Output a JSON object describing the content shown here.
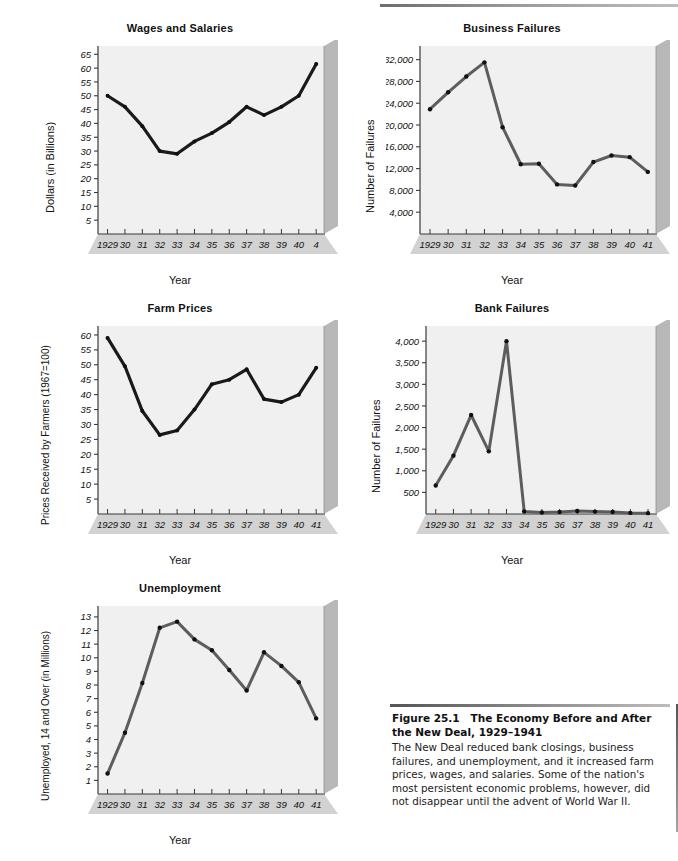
{
  "page": {
    "figure_number": "Figure 25.1",
    "figure_title": "The Economy Before and After the New Deal, 1929–1941",
    "caption_text": "The New Deal reduced bank closings, business failures, and unemployment, and it increased farm prices, wages, and salaries. Some of the nation's most persistent economic problems, however, did not disappear until the advent of World War II."
  },
  "style": {
    "line_color": "#5d5d5d",
    "line_color_dark": "#1a1a1a",
    "plot_bg": "#f0f0f0",
    "bevel_shadow": "#b4b4b4",
    "axis_color": "#3a3a3a",
    "text_color": "#111111"
  },
  "chart_data": [
    {
      "id": "wages-and-salaries",
      "type": "line",
      "title": "Wages and Salaries",
      "xlabel": "Year",
      "ylabel": "Dollars (in Billions)",
      "categories": [
        "1929",
        "30",
        "31",
        "32",
        "33",
        "34",
        "35",
        "36",
        "37",
        "38",
        "39",
        "40",
        "41"
      ],
      "tick_labels": [
        "1929",
        "30",
        "31",
        "32",
        "33",
        "34",
        "35",
        "36",
        "37",
        "38",
        "39",
        "40",
        "4"
      ],
      "yticks": [
        5,
        10,
        15,
        20,
        25,
        30,
        35,
        40,
        45,
        50,
        55,
        60,
        65
      ],
      "ylim": [
        0,
        68
      ],
      "values": [
        50.0,
        46.0,
        39.0,
        30.0,
        29.0,
        33.5,
        36.5,
        40.5,
        46.0,
        43.0,
        46.0,
        50.0,
        61.5
      ],
      "grid": false
    },
    {
      "id": "business-failures",
      "type": "line",
      "title": "Business Failures",
      "xlabel": "Year",
      "ylabel": "Number of Failures",
      "categories": [
        "1929",
        "30",
        "31",
        "32",
        "33",
        "34",
        "35",
        "36",
        "37",
        "38",
        "39",
        "40",
        "41"
      ],
      "tick_labels": [
        "1929",
        "30",
        "31",
        "32",
        "33",
        "34",
        "35",
        "36",
        "37",
        "38",
        "39",
        "40",
        "41"
      ],
      "yticks": [
        4000,
        8000,
        12000,
        16000,
        20000,
        24000,
        28000,
        32000
      ],
      "ytick_labels": [
        "4,000",
        "8,000",
        "12,000",
        "16,000",
        "20,000",
        "24,000",
        "28,000",
        "32,000"
      ],
      "ylim": [
        0,
        34500
      ],
      "values": [
        22900,
        26000,
        28900,
        31500,
        19600,
        12800,
        12900,
        9100,
        8900,
        13200,
        14400,
        14100,
        11400
      ],
      "grid": false
    },
    {
      "id": "farm-prices",
      "type": "line",
      "title": "Farm Prices",
      "xlabel": "Year",
      "ylabel": "Prices Received by Farmers (1967=100)",
      "categories": [
        "1929",
        "30",
        "31",
        "32",
        "33",
        "34",
        "35",
        "36",
        "37",
        "38",
        "39",
        "40",
        "41"
      ],
      "tick_labels": [
        "1929",
        "30",
        "31",
        "32",
        "33",
        "34",
        "35",
        "36",
        "37",
        "38",
        "39",
        "40",
        "41"
      ],
      "yticks": [
        5,
        10,
        15,
        20,
        25,
        30,
        35,
        40,
        45,
        50,
        55,
        60
      ],
      "ylim": [
        0,
        63
      ],
      "values": [
        59.0,
        49.5,
        34.5,
        26.5,
        28.0,
        35.0,
        43.5,
        45.0,
        48.5,
        38.5,
        37.5,
        40.0,
        49.0
      ],
      "grid": false
    },
    {
      "id": "bank-failures",
      "type": "line",
      "title": "Bank Failures",
      "xlabel": "Year",
      "ylabel": "Number of Failures",
      "categories": [
        "1929",
        "30",
        "31",
        "32",
        "33",
        "34",
        "35",
        "36",
        "37",
        "38",
        "39",
        "40",
        "41"
      ],
      "tick_labels": [
        "1929",
        "30",
        "31",
        "32",
        "33",
        "34",
        "35",
        "36",
        "37",
        "38",
        "39",
        "40",
        "41"
      ],
      "yticks": [
        500,
        1000,
        1500,
        2000,
        2500,
        3000,
        3500,
        4000
      ],
      "ytick_labels": [
        "500",
        "1,000",
        "1,500",
        "2,000",
        "2,500",
        "3,000",
        "3,500",
        "4,000"
      ],
      "ylim": [
        0,
        4350
      ],
      "values": [
        660,
        1350,
        2290,
        1450,
        4000,
        60,
        35,
        45,
        70,
        55,
        45,
        25,
        20
      ],
      "grid": false
    },
    {
      "id": "unemployment",
      "type": "line",
      "title": "Unemployment",
      "xlabel": "Year",
      "ylabel": "Unemployed, 14 and Over (in Millions)",
      "categories": [
        "1929",
        "30",
        "31",
        "32",
        "33",
        "34",
        "35",
        "36",
        "37",
        "38",
        "39",
        "40",
        "41"
      ],
      "tick_labels": [
        "1929",
        "30",
        "31",
        "32",
        "33",
        "34",
        "35",
        "36",
        "37",
        "38",
        "39",
        "40",
        "41"
      ],
      "yticks": [
        1,
        2,
        3,
        4,
        5,
        6,
        7,
        8,
        9,
        10,
        11,
        12,
        13
      ],
      "ylim": [
        0,
        13.8
      ],
      "values": [
        1.5,
        4.5,
        8.15,
        12.2,
        12.65,
        11.35,
        10.55,
        9.1,
        7.6,
        10.4,
        9.4,
        8.2,
        5.55
      ],
      "grid": false
    }
  ]
}
